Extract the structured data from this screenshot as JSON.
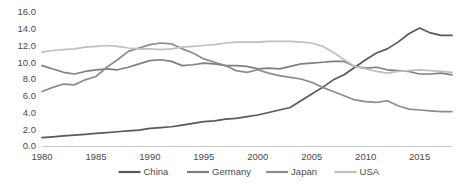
{
  "chart_data": {
    "type": "line",
    "title": "",
    "xlabel": "",
    "ylabel": "",
    "xlim": [
      1980,
      2018
    ],
    "ylim": [
      0.0,
      16.0
    ],
    "grid": false,
    "legend_position": "bottom",
    "y_ticks": [
      "0.0",
      "2.0",
      "4.0",
      "6.0",
      "8.0",
      "10.0",
      "12.0",
      "14.0",
      "16.0"
    ],
    "y_tick_values": [
      0.0,
      2.0,
      4.0,
      6.0,
      8.0,
      10.0,
      12.0,
      14.0,
      16.0
    ],
    "x_ticks": [
      "1980",
      "1985",
      "1990",
      "1995",
      "2000",
      "2005",
      "2010",
      "2015"
    ],
    "x_tick_values": [
      1980,
      1985,
      1990,
      1995,
      2000,
      2005,
      2010,
      2015
    ],
    "x": [
      1980,
      1981,
      1982,
      1983,
      1984,
      1985,
      1986,
      1987,
      1988,
      1989,
      1990,
      1991,
      1992,
      1993,
      1994,
      1995,
      1996,
      1997,
      1998,
      1999,
      2000,
      2001,
      2002,
      2003,
      2004,
      2005,
      2006,
      2007,
      2008,
      2009,
      2010,
      2011,
      2012,
      2013,
      2014,
      2015,
      2016,
      2017,
      2018
    ],
    "series": [
      {
        "name": "China",
        "color": "#595959",
        "values": [
          1.0,
          1.1,
          1.2,
          1.3,
          1.4,
          1.5,
          1.6,
          1.7,
          1.8,
          1.9,
          2.1,
          2.2,
          2.3,
          2.5,
          2.7,
          2.9,
          3.0,
          3.2,
          3.3,
          3.5,
          3.7,
          4.0,
          4.3,
          4.6,
          5.4,
          6.2,
          7.0,
          7.9,
          8.5,
          9.4,
          10.3,
          11.1,
          11.6,
          12.4,
          13.4,
          14.1,
          13.5,
          13.2,
          13.2
        ]
      },
      {
        "name": "Germany",
        "color": "#7f7f7f",
        "values": [
          9.6,
          9.2,
          8.8,
          8.6,
          8.9,
          9.1,
          9.2,
          9.1,
          9.4,
          9.8,
          10.2,
          10.3,
          10.1,
          9.6,
          9.7,
          9.9,
          9.8,
          9.6,
          9.6,
          9.5,
          9.2,
          9.3,
          9.2,
          9.5,
          9.8,
          9.9,
          10.0,
          10.1,
          10.1,
          9.5,
          9.3,
          9.4,
          9.1,
          9.0,
          8.9,
          8.6,
          8.6,
          8.7,
          8.5
        ]
      },
      {
        "name": "Japan",
        "color": "#8c8c8c",
        "values": [
          6.5,
          7.0,
          7.4,
          7.3,
          7.9,
          8.3,
          9.4,
          10.3,
          11.3,
          11.7,
          12.1,
          12.3,
          12.2,
          11.6,
          11.1,
          10.4,
          10.0,
          9.6,
          9.0,
          8.8,
          9.1,
          8.7,
          8.4,
          8.2,
          8.0,
          7.6,
          7.0,
          6.5,
          6.0,
          5.5,
          5.3,
          5.2,
          5.4,
          4.8,
          4.4,
          4.3,
          4.2,
          4.1,
          4.1
        ]
      },
      {
        "name": "USA",
        "color": "#bfbfbf",
        "values": [
          11.2,
          11.4,
          11.5,
          11.6,
          11.8,
          11.9,
          12.0,
          11.9,
          11.7,
          11.6,
          11.6,
          11.5,
          11.6,
          11.8,
          11.9,
          12.0,
          12.1,
          12.3,
          12.4,
          12.4,
          12.4,
          12.5,
          12.5,
          12.5,
          12.4,
          12.3,
          11.9,
          11.2,
          10.3,
          9.5,
          9.2,
          8.9,
          8.7,
          8.9,
          9.0,
          9.1,
          9.0,
          8.9,
          8.8
        ]
      }
    ]
  },
  "legend": {
    "items": [
      {
        "label": "China",
        "color": "#595959"
      },
      {
        "label": "Germany",
        "color": "#7f7f7f"
      },
      {
        "label": "Japan",
        "color": "#8c8c8c"
      },
      {
        "label": "USA",
        "color": "#bfbfbf"
      }
    ]
  }
}
